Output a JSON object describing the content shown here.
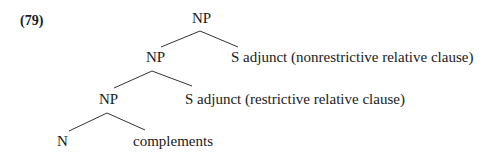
{
  "example_number": "(79)",
  "tree": {
    "root": "NP",
    "level1": {
      "left": "NP",
      "right": "S adjunct (nonrestrictive relative clause)"
    },
    "level2": {
      "left": "NP",
      "right": "S adjunct (restrictive relative clause)"
    },
    "level3": {
      "left": "N",
      "right": "complements"
    }
  }
}
